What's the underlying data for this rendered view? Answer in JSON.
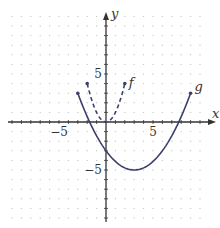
{
  "chart_data": {
    "type": "line",
    "title": "",
    "xlabel": "x",
    "ylabel": "y",
    "xlim": [
      -10,
      10
    ],
    "ylim": [
      -10,
      11
    ],
    "x_ticks_labeled": [
      -5,
      5
    ],
    "y_ticks_labeled": [
      5,
      -5
    ],
    "x_tick_labels": [
      "−5",
      "5"
    ],
    "y_tick_labels": [
      "5",
      "−5"
    ],
    "grid": "dots at integer coordinates",
    "series": [
      {
        "name": "f",
        "style": "dashed",
        "formula": "f(x) = x^2",
        "domain": [
          -2,
          2
        ],
        "endpoints": [
          [
            -2,
            4
          ],
          [
            2,
            4
          ]
        ],
        "vertex": [
          0,
          0
        ],
        "x": [
          -2,
          -1.5,
          -1,
          -0.5,
          0,
          0.5,
          1,
          1.5,
          2
        ],
        "values": [
          4,
          2.25,
          1,
          0.25,
          0,
          0.25,
          1,
          2.25,
          4
        ]
      },
      {
        "name": "g",
        "style": "solid",
        "formula": "g(x) = (2/9)(x - 3)^2 - 5",
        "domain": [
          -3,
          9
        ],
        "endpoints": [
          [
            -3,
            3
          ],
          [
            9,
            3
          ]
        ],
        "vertex": [
          3,
          -5
        ],
        "x": [
          -3,
          -1.5,
          0,
          1.5,
          3,
          4.5,
          6,
          7.5,
          9
        ],
        "values": [
          3,
          -0.5,
          -3,
          -4.5,
          -5,
          -4.5,
          -3,
          -0.5,
          3
        ]
      }
    ],
    "colors": {
      "curve": "#3b3f6c",
      "axis": "#333333",
      "grid_dot": "#c8c8c8"
    },
    "annotations": [
      {
        "text": "f",
        "near": [
          2,
          4
        ]
      },
      {
        "text": "g",
        "near": [
          9,
          3
        ]
      }
    ]
  }
}
